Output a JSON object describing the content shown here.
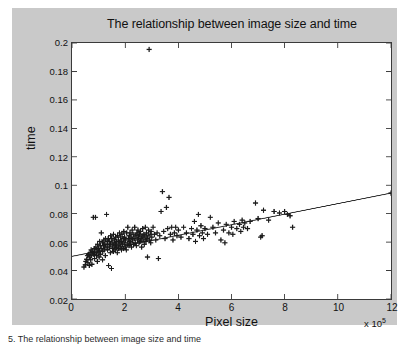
{
  "figure": {
    "background_color": "#c9c9c9",
    "plot_background_color": "#ffffff",
    "axis_color": "#3a3a3a",
    "marker_color": "#1a1a1a",
    "line_color": "#2a2a2a"
  },
  "caption": "5. The relationship between image size and time",
  "exponent_prefix": "x 10",
  "exponent_power": "5",
  "chart_data": {
    "type": "scatter",
    "title": "The relationship between image size and time",
    "xlabel": "Pixel size",
    "ylabel": "time",
    "x_exponent_label": "x 10^5",
    "xlim": [
      0,
      12
    ],
    "ylim": [
      0.02,
      0.2
    ],
    "xticks": [
      0,
      2,
      4,
      6,
      8,
      10,
      12
    ],
    "xtick_labels": [
      "0",
      "2",
      "4",
      "6",
      "8",
      "10",
      "12"
    ],
    "yticks": [
      0.02,
      0.04,
      0.06,
      0.08,
      0.1,
      0.12,
      0.14,
      0.16,
      0.18,
      0.2
    ],
    "ytick_labels": [
      "0.02",
      "0.04",
      "0.06",
      "0.08",
      "0.1",
      "0.12",
      "0.14",
      "0.16",
      "0.18",
      "0.2"
    ],
    "grid": false,
    "legend": null,
    "marker": "+",
    "series": [
      {
        "name": "measurements",
        "points": [
          [
            0.45,
            0.0425
          ],
          [
            0.5,
            0.044
          ],
          [
            0.52,
            0.0465
          ],
          [
            0.55,
            0.048
          ],
          [
            0.58,
            0.0505
          ],
          [
            0.6,
            0.0455
          ],
          [
            0.62,
            0.0515
          ],
          [
            0.65,
            0.0435
          ],
          [
            0.66,
            0.0495
          ],
          [
            0.68,
            0.0525
          ],
          [
            0.7,
            0.0475
          ],
          [
            0.72,
            0.0545
          ],
          [
            0.74,
            0.0505
          ],
          [
            0.75,
            0.0445
          ],
          [
            0.78,
            0.0535
          ],
          [
            0.8,
            0.0775
          ],
          [
            0.82,
            0.0515
          ],
          [
            0.84,
            0.0555
          ],
          [
            0.85,
            0.0485
          ],
          [
            0.86,
            0.0525
          ],
          [
            0.88,
            0.0775
          ],
          [
            0.9,
            0.0565
          ],
          [
            0.92,
            0.0505
          ],
          [
            0.94,
            0.0545
          ],
          [
            0.95,
            0.0465
          ],
          [
            0.96,
            0.0585
          ],
          [
            0.98,
            0.0525
          ],
          [
            1.0,
            0.0555
          ],
          [
            1.02,
            0.0495
          ],
          [
            1.04,
            0.0605
          ],
          [
            1.05,
            0.0535
          ],
          [
            1.06,
            0.0575
          ],
          [
            1.08,
            0.0515
          ],
          [
            1.1,
            0.0665
          ],
          [
            1.12,
            0.0555
          ],
          [
            1.14,
            0.0595
          ],
          [
            1.15,
            0.0475
          ],
          [
            1.16,
            0.0535
          ],
          [
            1.18,
            0.0575
          ],
          [
            1.2,
            0.0615
          ],
          [
            1.22,
            0.0545
          ],
          [
            1.24,
            0.0585
          ],
          [
            1.25,
            0.0505
          ],
          [
            1.26,
            0.0625
          ],
          [
            1.28,
            0.0565
          ],
          [
            1.3,
            0.0795
          ],
          [
            1.32,
            0.0605
          ],
          [
            1.34,
            0.0545
          ],
          [
            1.35,
            0.0585
          ],
          [
            1.36,
            0.0625
          ],
          [
            1.38,
            0.0435
          ],
          [
            1.4,
            0.0565
          ],
          [
            1.42,
            0.0605
          ],
          [
            1.44,
            0.0525
          ],
          [
            1.45,
            0.0645
          ],
          [
            1.46,
            0.0585
          ],
          [
            1.48,
            0.0415
          ],
          [
            1.5,
            0.0625
          ],
          [
            1.52,
            0.0555
          ],
          [
            1.54,
            0.0595
          ],
          [
            1.55,
            0.0535
          ],
          [
            1.56,
            0.0655
          ],
          [
            1.58,
            0.0575
          ],
          [
            1.6,
            0.0615
          ],
          [
            1.62,
            0.0545
          ],
          [
            1.64,
            0.0585
          ],
          [
            1.65,
            0.0635
          ],
          [
            1.66,
            0.0565
          ],
          [
            1.68,
            0.0605
          ],
          [
            1.7,
            0.0525
          ],
          [
            1.72,
            0.0645
          ],
          [
            1.74,
            0.0575
          ],
          [
            1.75,
            0.0615
          ],
          [
            1.76,
            0.0555
          ],
          [
            1.78,
            0.0665
          ],
          [
            1.8,
            0.0595
          ],
          [
            1.82,
            0.0635
          ],
          [
            1.84,
            0.0565
          ],
          [
            1.85,
            0.0605
          ],
          [
            1.86,
            0.0545
          ],
          [
            1.88,
            0.0655
          ],
          [
            1.9,
            0.0585
          ],
          [
            1.92,
            0.0625
          ],
          [
            1.94,
            0.0555
          ],
          [
            1.95,
            0.0675
          ],
          [
            1.96,
            0.0595
          ],
          [
            1.98,
            0.0635
          ],
          [
            2.0,
            0.0565
          ],
          [
            2.02,
            0.0615
          ],
          [
            2.04,
            0.0545
          ],
          [
            2.06,
            0.0665
          ],
          [
            2.08,
            0.0585
          ],
          [
            2.1,
            0.0705
          ],
          [
            2.12,
            0.0625
          ],
          [
            2.14,
            0.0575
          ],
          [
            2.15,
            0.0645
          ],
          [
            2.16,
            0.0605
          ],
          [
            2.18,
            0.0665
          ],
          [
            2.2,
            0.0595
          ],
          [
            2.22,
            0.0635
          ],
          [
            2.24,
            0.0565
          ],
          [
            2.26,
            0.0685
          ],
          [
            2.28,
            0.0615
          ],
          [
            2.3,
            0.0655
          ],
          [
            2.32,
            0.0585
          ],
          [
            2.34,
            0.0625
          ],
          [
            2.36,
            0.0705
          ],
          [
            2.38,
            0.0595
          ],
          [
            2.4,
            0.0645
          ],
          [
            2.42,
            0.0575
          ],
          [
            2.44,
            0.0665
          ],
          [
            2.46,
            0.0615
          ],
          [
            2.48,
            0.0685
          ],
          [
            2.5,
            0.0635
          ],
          [
            2.52,
            0.0595
          ],
          [
            2.54,
            0.0655
          ],
          [
            2.56,
            0.0605
          ],
          [
            2.58,
            0.0675
          ],
          [
            2.6,
            0.0625
          ],
          [
            2.62,
            0.0565
          ],
          [
            2.64,
            0.0645
          ],
          [
            2.66,
            0.0695
          ],
          [
            2.68,
            0.0615
          ],
          [
            2.7,
            0.0655
          ],
          [
            2.72,
            0.0585
          ],
          [
            2.74,
            0.0635
          ],
          [
            2.76,
            0.0705
          ],
          [
            2.78,
            0.0605
          ],
          [
            2.8,
            0.0665
          ],
          [
            2.82,
            0.0625
          ],
          [
            2.84,
            0.0495
          ],
          [
            2.86,
            0.0645
          ],
          [
            2.88,
            0.0685
          ],
          [
            2.9,
            0.1955
          ],
          [
            2.92,
            0.0615
          ],
          [
            2.94,
            0.0655
          ],
          [
            2.96,
            0.0595
          ],
          [
            2.98,
            0.0675
          ],
          [
            3.0,
            0.0635
          ],
          [
            3.05,
            0.0705
          ],
          [
            3.1,
            0.0655
          ],
          [
            3.15,
            0.0615
          ],
          [
            3.2,
            0.0665
          ],
          [
            3.25,
            0.0485
          ],
          [
            3.3,
            0.0645
          ],
          [
            3.35,
            0.0815
          ],
          [
            3.4,
            0.0955
          ],
          [
            3.45,
            0.0675
          ],
          [
            3.5,
            0.0625
          ],
          [
            3.55,
            0.0845
          ],
          [
            3.6,
            0.0695
          ],
          [
            3.65,
            0.0915
          ],
          [
            3.7,
            0.0655
          ],
          [
            3.75,
            0.0705
          ],
          [
            3.8,
            0.0615
          ],
          [
            3.85,
            0.0665
          ],
          [
            3.9,
            0.0705
          ],
          [
            3.95,
            0.0645
          ],
          [
            4.0,
            0.0685
          ],
          [
            4.1,
            0.0635
          ],
          [
            4.2,
            0.0705
          ],
          [
            4.3,
            0.0665
          ],
          [
            4.4,
            0.0625
          ],
          [
            4.5,
            0.0695
          ],
          [
            4.55,
            0.0655
          ],
          [
            4.6,
            0.0745
          ],
          [
            4.65,
            0.0605
          ],
          [
            4.7,
            0.0685
          ],
          [
            4.75,
            0.0795
          ],
          [
            4.8,
            0.0645
          ],
          [
            4.85,
            0.0715
          ],
          [
            4.9,
            0.0665
          ],
          [
            4.95,
            0.0625
          ],
          [
            5.0,
            0.0695
          ],
          [
            5.1,
            0.0655
          ],
          [
            5.2,
            0.0775
          ],
          [
            5.3,
            0.0705
          ],
          [
            5.4,
            0.0665
          ],
          [
            5.5,
            0.0735
          ],
          [
            5.6,
            0.0615
          ],
          [
            5.7,
            0.0685
          ],
          [
            5.75,
            0.0595
          ],
          [
            5.8,
            0.0725
          ],
          [
            5.9,
            0.0665
          ],
          [
            6.0,
            0.0705
          ],
          [
            6.05,
            0.0655
          ],
          [
            6.1,
            0.0745
          ],
          [
            6.2,
            0.0695
          ],
          [
            6.3,
            0.0725
          ],
          [
            6.35,
            0.0675
          ],
          [
            6.4,
            0.0755
          ],
          [
            6.45,
            0.0705
          ],
          [
            6.5,
            0.0735
          ],
          [
            6.6,
            0.0695
          ],
          [
            6.7,
            0.0745
          ],
          [
            6.9,
            0.0875
          ],
          [
            7.0,
            0.0765
          ],
          [
            7.1,
            0.0635
          ],
          [
            7.15,
            0.0645
          ],
          [
            7.2,
            0.0825
          ],
          [
            7.4,
            0.0755
          ],
          [
            7.6,
            0.0815
          ],
          [
            7.8,
            0.0805
          ],
          [
            8.0,
            0.0815
          ],
          [
            8.1,
            0.0795
          ],
          [
            8.2,
            0.0785
          ],
          [
            8.3,
            0.0705
          ],
          [
            12.0,
            0.0945
          ]
        ]
      }
    ],
    "trendline": {
      "name": "linear fit",
      "x": [
        0,
        12
      ],
      "y": [
        0.05,
        0.0945
      ]
    }
  }
}
